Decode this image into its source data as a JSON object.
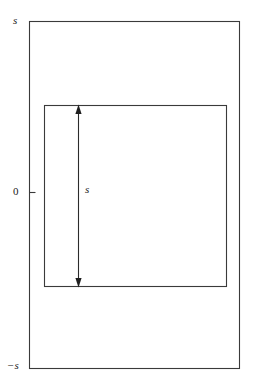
{
  "figure": {
    "background_color": "#ffffff",
    "line_color": "#3a3a3a",
    "text_color": "#1a1a1a",
    "labels": {
      "axis_top": "s",
      "axis_origin": "0",
      "axis_bottom": "−s",
      "dimension": "s"
    },
    "outer_rect": {
      "name": "outer-square",
      "x": 29,
      "y": 21,
      "width": 211,
      "height": 348
    },
    "inner_rect": {
      "name": "inner-square",
      "x": 44,
      "y": 105,
      "width": 183,
      "height": 182
    },
    "dimension_arrow": {
      "name": "vertical-dimension-arrow",
      "x": 78,
      "y_top": 105,
      "y_bottom": 287,
      "label": "s",
      "double_headed": true
    },
    "origin_tick": {
      "name": "origin-tick-mark",
      "x_start": 29,
      "x_end": 35,
      "y": 192
    }
  }
}
